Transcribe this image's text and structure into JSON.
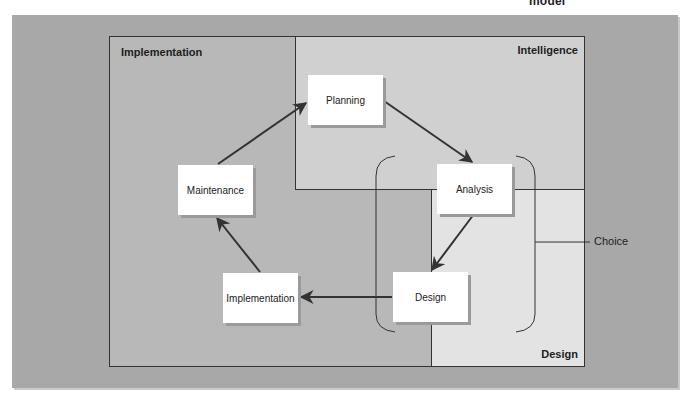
{
  "caption": {
    "top_text": "model"
  },
  "regions": {
    "implementation": {
      "label": "Implementation",
      "color": "#b8b8b8"
    },
    "intelligence": {
      "label": "Intelligence",
      "color": "#d0d0d0"
    },
    "design": {
      "label": "Design",
      "color": "#e3e3e3"
    },
    "outer_color": "#a8a8a8"
  },
  "nodes": [
    {
      "id": "planning",
      "label": "Planning"
    },
    {
      "id": "analysis",
      "label": "Analysis"
    },
    {
      "id": "design",
      "label": "Design"
    },
    {
      "id": "implementation",
      "label": "Implementation"
    },
    {
      "id": "maintenance",
      "label": "Maintenance"
    }
  ],
  "edges": [
    {
      "from": "Maintenance",
      "to": "Planning"
    },
    {
      "from": "Planning",
      "to": "Analysis"
    },
    {
      "from": "Analysis",
      "to": "Design"
    },
    {
      "from": "Design",
      "to": "Implementation"
    },
    {
      "from": "Implementation",
      "to": "Maintenance"
    }
  ],
  "bracket": {
    "label": "Choice",
    "groups": [
      "Analysis",
      "Design"
    ]
  }
}
